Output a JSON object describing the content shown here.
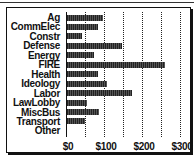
{
  "chart_data": {
    "type": "bar",
    "orientation": "horizontal",
    "title": "",
    "xlabel": "",
    "ylabel": "",
    "categories": [
      "Ag",
      "CommElec",
      "Constr",
      "Defense",
      "Energy",
      "FIRE",
      "Health",
      "Ideology",
      "Labor",
      "LawLobby",
      "MiscBus",
      "Transport",
      "Other"
    ],
    "values": [
      95,
      82,
      40,
      145,
      70,
      258,
      82,
      105,
      172,
      52,
      83,
      47,
      0
    ],
    "xlim": [
      0,
      300
    ],
    "xticks": [
      "$0",
      "$100",
      "$200",
      "$300"
    ],
    "grid": true,
    "grid_step": 50,
    "legend": null
  },
  "colors": {
    "bar": "#222222",
    "frame": "#111111",
    "background": "#ffffff"
  }
}
